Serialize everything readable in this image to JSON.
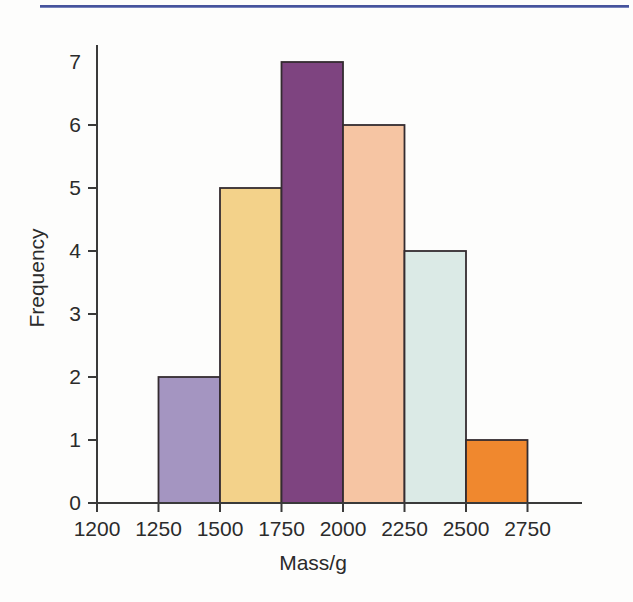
{
  "page": {
    "background": "#fdfdfc",
    "top_rule_color_dark": "#46539c",
    "top_rule_color_light": "#9aa6d2"
  },
  "chart_data": {
    "type": "bar",
    "subtype": "histogram",
    "title": "",
    "xlabel": "Mass/g",
    "ylabel": "Frequency",
    "x_ticks": [
      1200,
      1250,
      1500,
      1750,
      2000,
      2250,
      2500,
      2750
    ],
    "y_ticks": [
      0,
      1,
      2,
      3,
      4,
      5,
      6,
      7
    ],
    "ylim": [
      0,
      7
    ],
    "grid": false,
    "legend": false,
    "bins": [
      {
        "range": [
          1250,
          1500
        ],
        "frequency": 2,
        "color": "#a495c1"
      },
      {
        "range": [
          1500,
          1750
        ],
        "frequency": 5,
        "color": "#f3d28a"
      },
      {
        "range": [
          1750,
          2000
        ],
        "frequency": 7,
        "color": "#7e4480"
      },
      {
        "range": [
          2000,
          2250
        ],
        "frequency": 6,
        "color": "#f6c5a3"
      },
      {
        "range": [
          2250,
          2500
        ],
        "frequency": 4,
        "color": "#dbeae6"
      },
      {
        "range": [
          2500,
          2750
        ],
        "frequency": 1,
        "color": "#f0882e"
      }
    ],
    "bar_border_color": "#342c30",
    "axis_color": "#3a3a3a",
    "label_color": "#2b2b2b"
  }
}
